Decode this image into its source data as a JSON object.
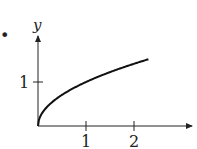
{
  "bullet": "•",
  "chart_data": {
    "type": "line",
    "title": "",
    "xlabel": "x",
    "ylabel": "y",
    "function": "y = sqrt(x)",
    "x": [
      0,
      0.1,
      0.25,
      0.5,
      0.75,
      1,
      1.25,
      1.5,
      1.75,
      2,
      2.25,
      2.3
    ],
    "series": [
      {
        "name": "y = √x",
        "values": [
          0,
          0.316,
          0.5,
          0.707,
          0.866,
          1,
          1.118,
          1.225,
          1.323,
          1.414,
          1.5,
          1.517
        ]
      }
    ],
    "x_ticks": [
      "1",
      "2"
    ],
    "y_ticks": [
      "1"
    ],
    "xlim": [
      0,
      3.2
    ],
    "ylim": [
      0,
      2.0
    ],
    "grid": false,
    "legend": "none"
  },
  "colors": {
    "axis": "#222222",
    "curve": "#111111"
  }
}
